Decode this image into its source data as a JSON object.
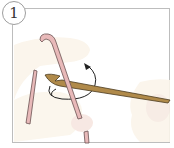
{
  "step": {
    "number": "1"
  },
  "illustration": {
    "subject": "crochet hook inserted through yarn loop with rotation arrow",
    "colors": {
      "frame_border": "#bdbdbd",
      "hand_fill": "#fbf5ea",
      "hand_fill_2": "#f7ebe3",
      "yarn_fill": "#e8b9b9",
      "yarn_stroke": "#6b5252",
      "hook_fill": "#b08a4a",
      "hook_stroke": "#4a3a1e",
      "arrow": "#222222"
    }
  }
}
